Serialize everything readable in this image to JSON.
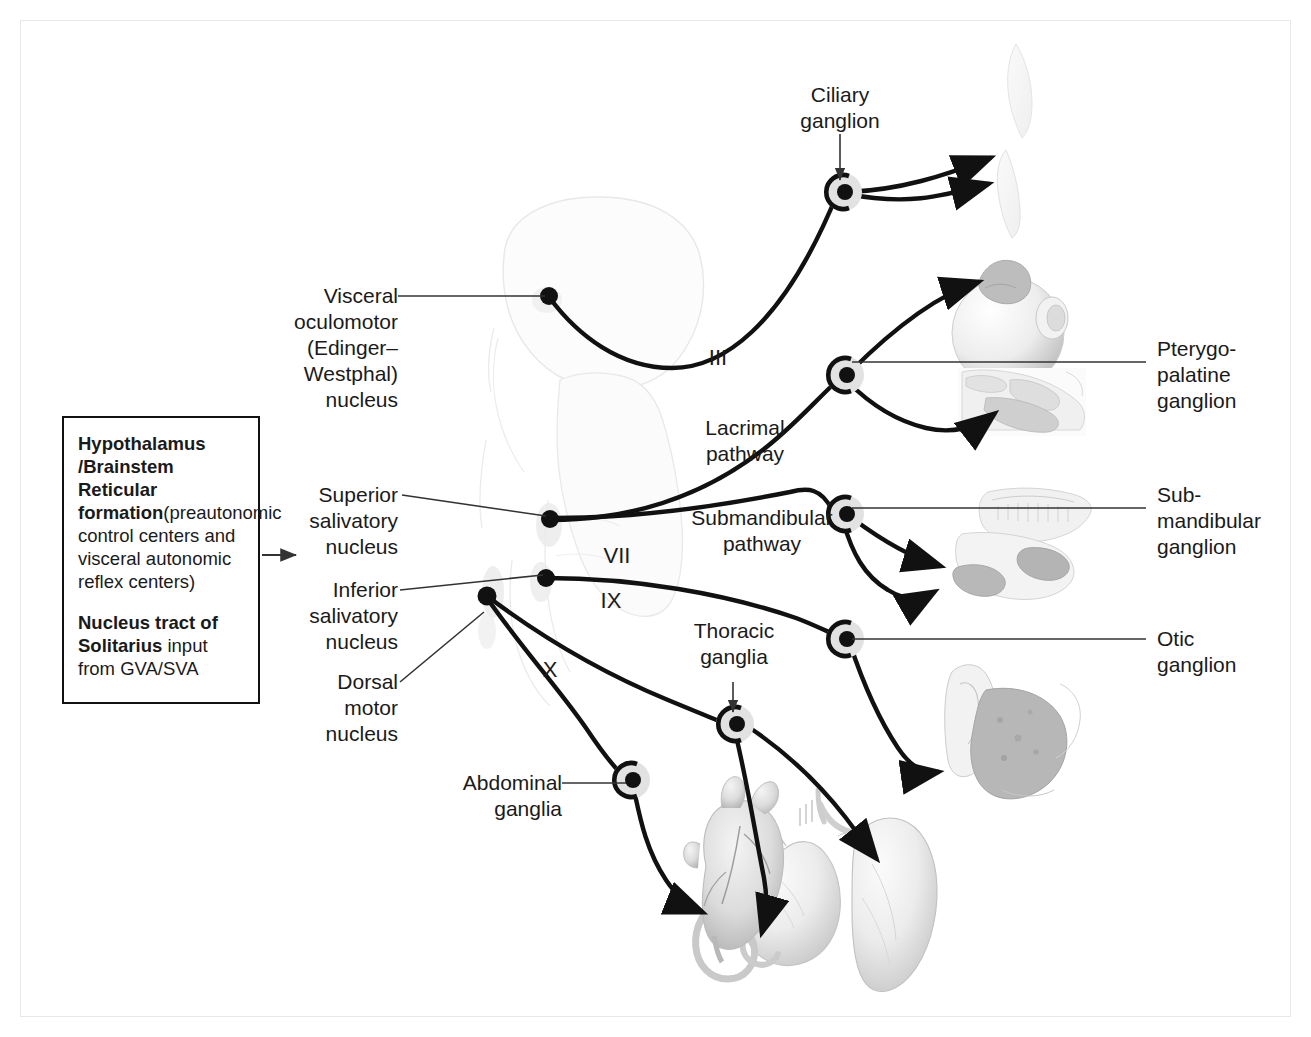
{
  "info_box": {
    "heading": "Hypothalamus\n/Brainstem\nReticular formation",
    "subtext": "(preautonomic\ncontrol centers and\nvisceral autonomic\nreflex centers)",
    "heading2_strong": "Nucleus tract of\nSolitarius",
    "heading2_rest": " input\nfrom GVA/SVA"
  },
  "left_labels": [
    {
      "name": "visceral-oculomotor-nucleus",
      "text": "Visceral\noculomotor\n(Edinger–\nWestphal)\nnucleus"
    },
    {
      "name": "superior-salivatory-nucleus",
      "text": "Superior\nsalivatory\nnucleus"
    },
    {
      "name": "inferior-salivatory-nucleus",
      "text": "Inferior\nsalivatory\nnucleus"
    },
    {
      "name": "dorsal-motor-nucleus",
      "text": "Dorsal\nmotor\nnucleus"
    },
    {
      "name": "abdominal-ganglia",
      "text": "Abdominal\nganglia"
    }
  ],
  "right_labels": [
    {
      "name": "pterygopalatine-ganglion",
      "text": "Pterygo-\npalatine\nganglion"
    },
    {
      "name": "submandibular-ganglion",
      "text": "Sub-\nmandibular\nganglion"
    },
    {
      "name": "otic-ganglion",
      "text": "Otic\nganglion"
    }
  ],
  "center_labels": [
    {
      "name": "ciliary-ganglion",
      "text": "Ciliary\nganglion"
    },
    {
      "name": "lacrimal-pathway",
      "text": "Lacrimal\npathway"
    },
    {
      "name": "submandibular-pathway",
      "text": "Submandibular\npathway"
    },
    {
      "name": "thoracic-ganglia",
      "text": "Thoracic\nganglia"
    }
  ],
  "cranial_nerve_numerals": [
    {
      "name": "cn-iii",
      "text": "III"
    },
    {
      "name": "cn-vii",
      "text": "VII"
    },
    {
      "name": "cn-ix",
      "text": "IX"
    },
    {
      "name": "cn-x",
      "text": "X"
    }
  ],
  "colors": {
    "ink": "#1a1a1a",
    "pathway": "#111111",
    "leader": "#333333",
    "halo": "#e2e2e2",
    "brainstem_outline": "#d8d8d8",
    "organ_fill": "#e9e9e9",
    "organ_shade": "#cfcfcf",
    "frame": "#e8e8e8"
  }
}
